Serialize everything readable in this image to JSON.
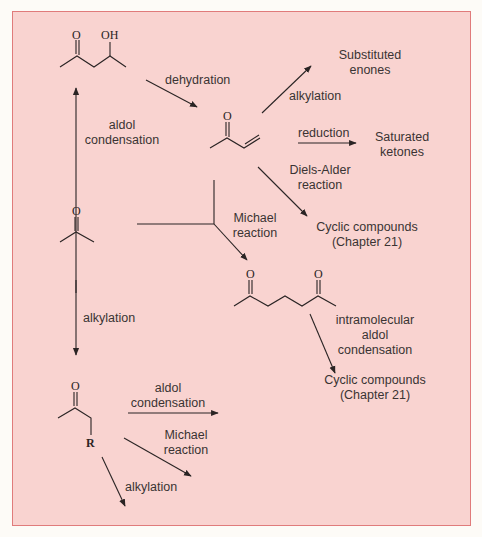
{
  "colors": {
    "background": "#f9d3d0",
    "border": "#e07b7b",
    "ink": "#2a2424"
  },
  "molecules": {
    "hydroxyketone": {
      "atoms": [
        "O",
        "OH"
      ]
    },
    "enone": {
      "atoms": [
        "O"
      ]
    },
    "acetone": {
      "atoms": [
        "O"
      ]
    },
    "diketone": {
      "atoms": [
        "O",
        "O"
      ]
    },
    "alkyl_ketone": {
      "atoms": [
        "O",
        "R"
      ]
    }
  },
  "labels": {
    "dehydration": "dehydration",
    "aldol_condensation_1": [
      "aldol",
      "condensation"
    ],
    "alkylation_enone": "alkylation",
    "substituted_enones": [
      "Substituted",
      "enones"
    ],
    "reduction": "reduction",
    "saturated_ketones": [
      "Saturated",
      "ketones"
    ],
    "diels_alder": [
      "Diels-Alder",
      "reaction"
    ],
    "cyclic_compounds_1": [
      "Cyclic compounds",
      "(Chapter 21)"
    ],
    "michael_1": [
      "Michael",
      "reaction"
    ],
    "alkylation_acetone": "alkylation",
    "intramolecular": [
      "intramolecular",
      "aldol",
      "condensation"
    ],
    "cyclic_compounds_2": [
      "Cyclic compounds",
      "(Chapter 21)"
    ],
    "aldol_condensation_2": [
      "aldol",
      "condensation"
    ],
    "michael_2": [
      "Michael",
      "reaction"
    ],
    "alkylation_bottom": "alkylation"
  }
}
